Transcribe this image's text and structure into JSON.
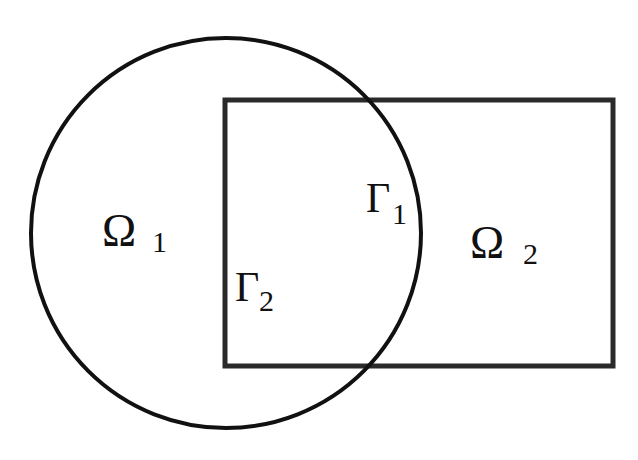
{
  "diagram": {
    "type": "domain-decomposition",
    "stroke_color": "#111111",
    "background": "#ffffff",
    "shapes": {
      "circle": {
        "name": "Omega 1 region",
        "cx": 226,
        "cy": 233,
        "r": 195
      },
      "rectangle": {
        "name": "Omega 2 region",
        "x": 225,
        "y": 100,
        "width": 388,
        "height": 266
      }
    },
    "labels": {
      "omega1": {
        "symbol": "Ω",
        "subscript": "1"
      },
      "omega2": {
        "symbol": "Ω",
        "subscript": "2"
      },
      "gamma1": {
        "symbol": "Γ",
        "subscript": "1"
      },
      "gamma2": {
        "symbol": "Γ",
        "subscript": "2"
      }
    }
  }
}
